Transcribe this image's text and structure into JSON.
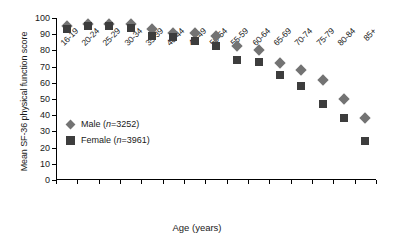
{
  "chart_data": {
    "type": "scatter",
    "title": "",
    "xlabel": "Age (years)",
    "ylabel": "Mean SF-36 physical function score",
    "categories": [
      "16-19",
      "20-24",
      "25-29",
      "30-34",
      "35-39",
      "40-44",
      "45-49",
      "50-54",
      "55-59",
      "60-64",
      "65-69",
      "70-74",
      "75-79",
      "80-84",
      "85+"
    ],
    "ylim": [
      0,
      100
    ],
    "yticks": [
      0,
      10,
      20,
      30,
      40,
      50,
      60,
      70,
      80,
      90,
      100
    ],
    "grid": false,
    "legend_position": "inside-left",
    "series": [
      {
        "name": "Male",
        "legend_label": "Male (n=3252)",
        "n": 3252,
        "marker": "diamond",
        "color": "#737373",
        "values": [
          95,
          96,
          96,
          96,
          93,
          91,
          91,
          89,
          83,
          80,
          72,
          68,
          62,
          50,
          38
        ]
      },
      {
        "name": "Female",
        "legend_label": "Female (n=3961)",
        "n": 3961,
        "marker": "square",
        "color": "#3d3d3d",
        "values": [
          93,
          95,
          95,
          94,
          89,
          88,
          86,
          83,
          74,
          73,
          65,
          58,
          47,
          38,
          24
        ]
      }
    ]
  }
}
